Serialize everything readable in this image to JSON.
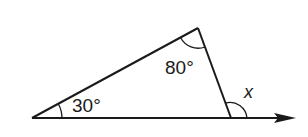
{
  "diagram": {
    "type": "triangle-exterior-angle",
    "angles": {
      "left": "30°",
      "top": "80°",
      "exterior": "x"
    },
    "colors": {
      "stroke": "#1a1a1a",
      "background": "#ffffff"
    }
  }
}
